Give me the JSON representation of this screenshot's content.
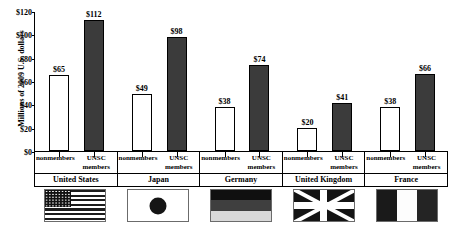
{
  "chart_data": {
    "type": "bar",
    "title": "",
    "xlabel": "",
    "ylabel": "Millions of 2009 U.S. dollars",
    "ylim": [
      0,
      120
    ],
    "ytick_labels": [
      "$0",
      "$20",
      "$40",
      "$60",
      "$80",
      "$100",
      "$120"
    ],
    "ytick_values": [
      0,
      20,
      40,
      60,
      80,
      100,
      120
    ],
    "grid": false,
    "legend_position": "none",
    "categories": [
      "United States",
      "Japan",
      "Germany",
      "United Kingdom",
      "France"
    ],
    "series": [
      {
        "name": "nonmembers",
        "values": [
          65,
          49,
          38,
          20,
          38
        ],
        "value_labels": [
          "$65",
          "$49",
          "$38",
          "$20",
          "$38"
        ]
      },
      {
        "name": "UNSC members",
        "values": [
          112,
          98,
          74,
          41,
          66
        ],
        "value_labels": [
          "$112",
          "$98",
          "$74",
          "$41",
          "$66"
        ]
      }
    ],
    "series_styles": [
      {
        "name": "nonmembers",
        "fill": "#ffffff",
        "border": "#000000"
      },
      {
        "name": "UNSC members",
        "fill": "#3b3b3b",
        "border": "#000000"
      }
    ]
  },
  "groups": [
    {
      "country": "United States",
      "nonmembers_label": "nonmembers",
      "unsc_label_line1": "UNSC",
      "unsc_label_line2": "members",
      "nonmembers_value": "$65",
      "unsc_value": "$112",
      "flag": "flag-united-states"
    },
    {
      "country": "Japan",
      "nonmembers_label": "nonmembers",
      "unsc_label_line1": "UNSC",
      "unsc_label_line2": "members",
      "nonmembers_value": "$49",
      "unsc_value": "$98",
      "flag": "flag-japan"
    },
    {
      "country": "Germany",
      "nonmembers_label": "nonmembers",
      "unsc_label_line1": "UNSC",
      "unsc_label_line2": "members",
      "nonmembers_value": "$38",
      "unsc_value": "$74",
      "flag": "flag-germany"
    },
    {
      "country": "United Kingdom",
      "nonmembers_label": "nonmembers",
      "unsc_label_line1": "UNSC",
      "unsc_label_line2": "members",
      "nonmembers_value": "$20",
      "unsc_value": "$41",
      "flag": "flag-united-kingdom"
    },
    {
      "country": "France",
      "nonmembers_label": "nonmembers",
      "unsc_label_line1": "UNSC",
      "unsc_label_line2": "members",
      "nonmembers_value": "$38",
      "unsc_value": "$66",
      "flag": "flag-france"
    }
  ]
}
